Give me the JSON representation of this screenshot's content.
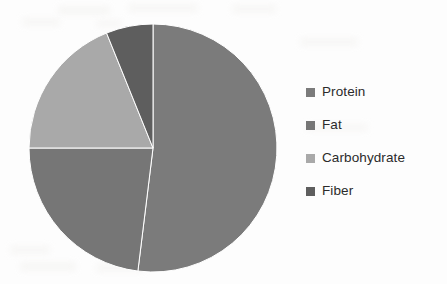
{
  "chart_data": {
    "type": "pie",
    "title": "",
    "subtitle": "",
    "xlabel": "",
    "ylabel": "",
    "grid": false,
    "legend_position": "right",
    "start_angle_deg": 0,
    "direction": "clockwise",
    "categories": [
      "Protein",
      "Fat",
      "Carbohydrate",
      "Fiber"
    ],
    "values": [
      52,
      23,
      19,
      6
    ],
    "units": "percent",
    "slices": [
      {
        "label": "Protein",
        "value": 52,
        "start_angle_deg": 0,
        "end_angle_deg": 187,
        "color": "#7b7b7b"
      },
      {
        "label": "Fat",
        "value": 23,
        "start_angle_deg": 187,
        "end_angle_deg": 270,
        "color": "#767676"
      },
      {
        "label": "Carbohydrate",
        "value": 19,
        "start_angle_deg": 270,
        "end_angle_deg": 338,
        "color": "#a9a9a9"
      },
      {
        "label": "Fiber",
        "value": 6,
        "start_angle_deg": 338,
        "end_angle_deg": 360,
        "color": "#5e5e5e"
      }
    ]
  },
  "legend": {
    "entries": [
      {
        "label": "Protein",
        "color": "#7b7b7b"
      },
      {
        "label": "Fat",
        "color": "#767676"
      },
      {
        "label": "Carbohydrate",
        "color": "#a9a9a9"
      },
      {
        "label": "Fiber",
        "color": "#5e5e5e"
      }
    ]
  },
  "colors": {
    "background": "#fdfdfd",
    "text": "#2b2b2b",
    "protein": "#7b7b7b",
    "fat": "#767676",
    "carbohydrate": "#a9a9a9",
    "fiber": "#5e5e5e"
  }
}
